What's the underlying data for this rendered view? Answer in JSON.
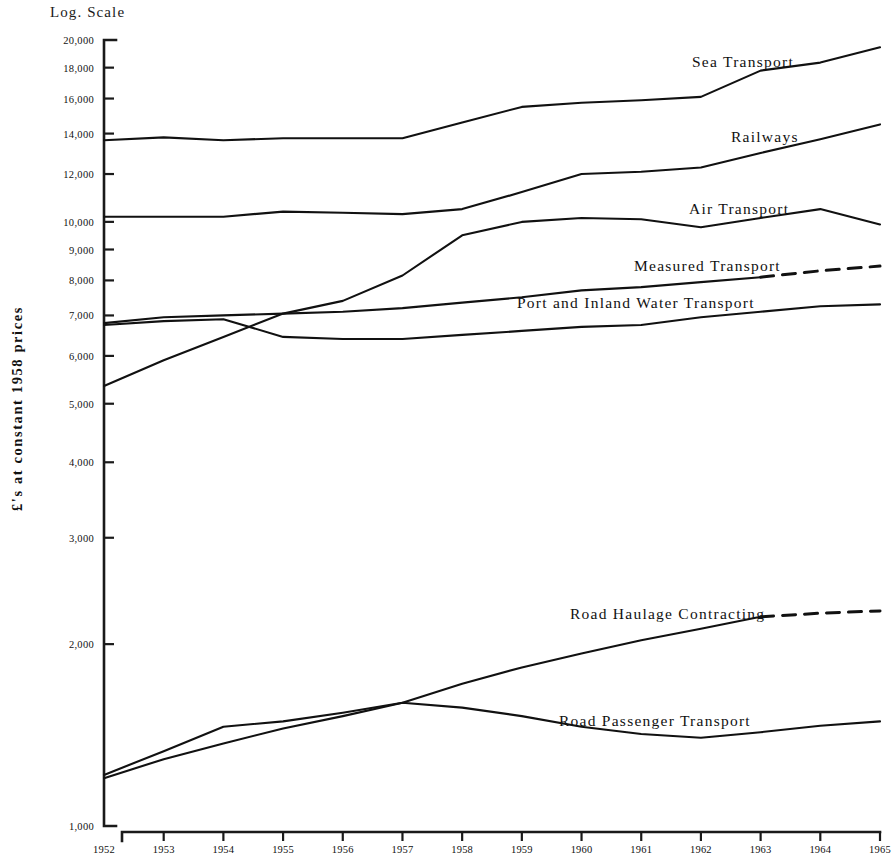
{
  "figure": {
    "scale_caption": "Log. Scale",
    "y_axis_title": "£'s at constant 1958 prices"
  },
  "chart_data": {
    "type": "line",
    "title": "",
    "subtitle": "",
    "xlabel": "",
    "ylabel": "£'s at constant 1958 prices",
    "scale": "log",
    "grid": false,
    "legend_position": "inline-labels-right",
    "x": [
      1952,
      1953,
      1954,
      1955,
      1956,
      1957,
      1958,
      1959,
      1960,
      1961,
      1962,
      1963,
      1964,
      1965
    ],
    "xtick_labels": [
      "1952",
      "1953",
      "1954",
      "1955",
      "1956",
      "1957",
      "1958",
      "1959",
      "1960",
      "1961",
      "1962",
      "1963",
      "1964",
      "1965"
    ],
    "ytick_labels": [
      "20,000",
      "18,000",
      "16,000",
      "14,000",
      "12,000",
      "10,000",
      "9,000",
      "8,000",
      "7,000",
      "6,000",
      "5,000",
      "4,000",
      "3,000",
      "2,000",
      "1,000"
    ],
    "yticks": [
      20000,
      18000,
      16000,
      14000,
      12000,
      10000,
      9000,
      8000,
      7000,
      6000,
      5000,
      4000,
      3000,
      2000,
      1000
    ],
    "ylim": [
      1000,
      20000
    ],
    "xlim": [
      1952,
      1965
    ],
    "series": [
      {
        "name": "Sea Transport",
        "label": "Sea Transport",
        "dashed_from": null,
        "values": [
          13650,
          13800,
          13650,
          13750,
          13750,
          13750,
          14600,
          15500,
          15750,
          15900,
          16100,
          17800,
          18350,
          19450
        ]
      },
      {
        "name": "Railways",
        "label": "Railways",
        "dashed_from": null,
        "values": [
          10200,
          10200,
          10200,
          10400,
          10350,
          10300,
          10500,
          11200,
          12000,
          12100,
          12300,
          13000,
          13700,
          14500
        ]
      },
      {
        "name": "Air Transport",
        "label": "Air Transport",
        "dashed_from": null,
        "values": [
          5350,
          5900,
          6450,
          7050,
          7400,
          8150,
          9500,
          10000,
          10150,
          10100,
          9800,
          10150,
          10500,
          9900
        ]
      },
      {
        "name": "Measured Transport",
        "label": "Measured Transport",
        "dashed_from": 1963,
        "values": [
          6800,
          6950,
          7000,
          7050,
          7100,
          7200,
          7350,
          7500,
          7700,
          7800,
          7950,
          8100,
          8300,
          8450
        ]
      },
      {
        "name": "Port and Inland Water Transport",
        "label": "Port and Inland Water Transport",
        "dashed_from": null,
        "values": [
          6750,
          6850,
          6900,
          6450,
          6400,
          6400,
          6500,
          6600,
          6700,
          6750,
          6950,
          7100,
          7250,
          7300
        ]
      },
      {
        "name": "Road Haulage Contracting",
        "label": "Road Haulage Contracting",
        "dashed_from": 1963,
        "values": [
          1200,
          1290,
          1370,
          1450,
          1520,
          1600,
          1720,
          1830,
          1930,
          2030,
          2120,
          2220,
          2250,
          2270
        ]
      },
      {
        "name": "Road Passenger Transport",
        "label": "Road Passenger Transport",
        "dashed_from": null,
        "values": [
          1215,
          1330,
          1460,
          1490,
          1540,
          1600,
          1570,
          1520,
          1460,
          1420,
          1400,
          1430,
          1465,
          1490
        ]
      }
    ],
    "annotations": [
      {
        "text": "Sea Transport",
        "x_px": 692,
        "y_px": 53
      },
      {
        "text": "Railways",
        "x_px": 731,
        "y_px": 128
      },
      {
        "text": "Air Transport",
        "x_px": 689,
        "y_px": 200
      },
      {
        "text": "Measured Transport",
        "x_px": 634,
        "y_px": 257
      },
      {
        "text": "Port and Inland Water Transport",
        "x_px": 517,
        "y_px": 294
      },
      {
        "text": "Road Haulage Contracting",
        "x_px": 570,
        "y_px": 605
      },
      {
        "text": "Road Passenger Transport",
        "x_px": 559,
        "y_px": 712
      }
    ]
  }
}
